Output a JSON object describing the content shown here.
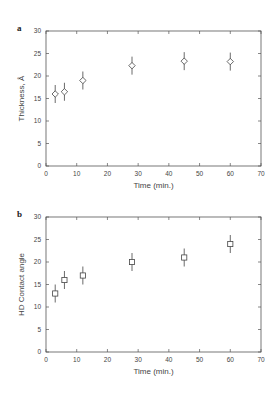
{
  "chart_data": [
    {
      "panel": "a",
      "type": "scatter",
      "title": "",
      "xlabel": "Time (min.)",
      "ylabel": "Thickness, Å",
      "xlim": [
        0,
        70
      ],
      "ylim": [
        0,
        30
      ],
      "xticks": [
        0,
        10,
        20,
        30,
        40,
        50,
        60,
        70
      ],
      "yticks": [
        0,
        5,
        10,
        15,
        20,
        25,
        30
      ],
      "marker": "diamond",
      "grid": false,
      "x": [
        3,
        6,
        12,
        28,
        45,
        60
      ],
      "values": [
        16,
        16.5,
        19,
        22.3,
        23.3,
        23.2
      ],
      "error": [
        2,
        2,
        2,
        2,
        2,
        2
      ]
    },
    {
      "panel": "b",
      "type": "scatter",
      "title": "",
      "xlabel": "Time (min.)",
      "ylabel": "HD Contact angle",
      "xlim": [
        0,
        70
      ],
      "ylim": [
        0,
        30
      ],
      "xticks": [
        0,
        10,
        20,
        30,
        40,
        50,
        60,
        70
      ],
      "yticks": [
        0,
        5,
        10,
        15,
        20,
        25,
        30
      ],
      "marker": "square",
      "grid": false,
      "x": [
        3,
        6,
        12,
        28,
        45,
        60
      ],
      "values": [
        13,
        16,
        17,
        20,
        21,
        24
      ],
      "error": [
        2,
        2,
        2,
        2,
        2,
        2
      ]
    }
  ],
  "panels": [
    {
      "label": "a",
      "xlabel": "Time (min.)",
      "ylabel": "Thickness, Å"
    },
    {
      "label": "b",
      "xlabel": "Time (min.)",
      "ylabel": "HD Contact angle"
    }
  ]
}
